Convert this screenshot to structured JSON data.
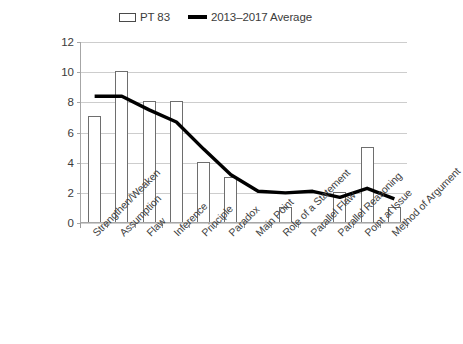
{
  "chart_data": {
    "type": "bar",
    "title": "",
    "xlabel": "",
    "ylabel": "",
    "ylim": [
      0,
      12
    ],
    "ytick_values": [
      0,
      2,
      4,
      6,
      8,
      10,
      12
    ],
    "grid": true,
    "legend_position": "top-center",
    "categories": [
      "Strengthen/Weaken",
      "Assumption",
      "Flaw",
      "Inference",
      "Principle",
      "Paradox",
      "Main Point",
      "Role of a Statement",
      "Parallel Flaw",
      "Parallel Reasoning",
      "Point at Issue",
      "Method of Argument"
    ],
    "series": [
      {
        "name": "PT 83",
        "type": "bar",
        "values": [
          7,
          10,
          8,
          8,
          4,
          3,
          0,
          1,
          0,
          2,
          5,
          1
        ],
        "color": "#ffffff",
        "edge_color": "#6e6e6e"
      },
      {
        "name": "2013–2017 Average",
        "type": "line",
        "values": [
          8.4,
          8.4,
          7.5,
          6.7,
          4.9,
          3.2,
          2.1,
          2.0,
          2.1,
          1.7,
          2.3,
          1.6
        ],
        "color": "#000000"
      }
    ]
  },
  "legend": {
    "entries": [
      {
        "label": "PT 83",
        "marker": "bar-swatch-icon"
      },
      {
        "label": "2013–2017 Average",
        "marker": "line-swatch-icon"
      }
    ]
  },
  "axis": {
    "y_labels": [
      "12",
      "10",
      "8",
      "6",
      "4",
      "2",
      "0"
    ]
  }
}
